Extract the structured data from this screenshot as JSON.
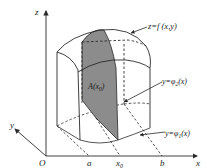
{
  "diagram": {
    "type": "3d-solid-cross-section",
    "axes": {
      "x_label": "x",
      "y_label": "y",
      "z_label": "z",
      "origin_label": "O"
    },
    "x_ticks": [
      {
        "label": "a"
      },
      {
        "label": "x",
        "subscript": "0"
      },
      {
        "label": "b"
      }
    ],
    "annotations": {
      "surface": "z=f (x,y)",
      "cross_section": {
        "prefix": "A(x",
        "subscript": "0",
        "suffix": ")"
      },
      "upper_curve": {
        "prefix": "y=φ",
        "subscript": "2",
        "suffix": "(x)"
      },
      "lower_curve": {
        "prefix": "y=φ",
        "subscript": "1",
        "suffix": "(x)"
      }
    },
    "colors": {
      "line": "#2a2a2a",
      "cross_section_fill": "#8c8c8c",
      "background": "#ffffff"
    }
  }
}
